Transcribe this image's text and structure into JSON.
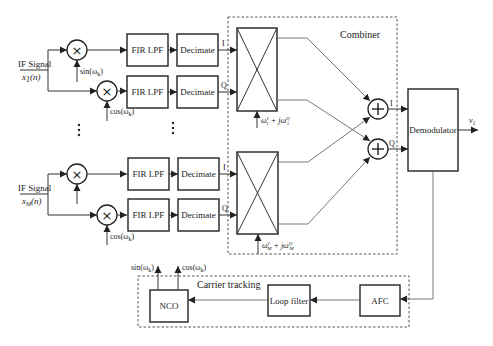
{
  "diagram": {
    "combiner": {
      "label": "Combiner"
    },
    "carrier_tracking": {
      "label": "Carrier tracking",
      "nco": "NCO",
      "loop_filter": "Loop filter",
      "afc": "AFC",
      "nco_out_sin": "sin(ω",
      "nco_out_sin_sub": "k",
      "nco_out_cos": "cos(ω",
      "nco_out_cos_sub": "k"
    },
    "demodulator": {
      "label": "Demodulator",
      "output": "v",
      "output_sub": "1"
    },
    "channels": [
      {
        "input_label": "IF Signal",
        "input_signal": "x",
        "input_signal_sub": "1",
        "input_signal_arg": "(n)",
        "mixer_i_ref": "sin(ω",
        "mixer_q_ref": "cos(ω",
        "ref_sub": "k",
        "filter_i": "FIR LPF",
        "filter_q": "FIR LPF",
        "decimate_i": "Decimate",
        "decimate_q": "Decimate",
        "i_label": "I",
        "q_label": "Q",
        "weight_label": "ω",
        "weight_sub": "1",
        "weight_plus": " + jω"
      },
      {
        "input_label": "IF Signal",
        "input_signal": "x",
        "input_signal_sub": "M",
        "input_signal_arg": "(n)",
        "mixer_q_ref": "cos(ω",
        "ref_sub": "k",
        "filter_i": "FIR LPF",
        "filter_q": "FIR LPF",
        "decimate_i": "Decimate",
        "decimate_q": "Decimate",
        "i_label": "I",
        "q_label": "Q",
        "weight_label": "ω",
        "weight_sub": "M",
        "weight_plus": " + jω"
      }
    ],
    "summers": [
      {
        "output_label": "I"
      },
      {
        "output_label": "Q"
      }
    ],
    "symbols": {
      "multiply": "×",
      "add": "+",
      "ellipsis": "⋮",
      "sup_i": "I",
      "sup_q": "Q",
      "close_paren": ")"
    }
  }
}
